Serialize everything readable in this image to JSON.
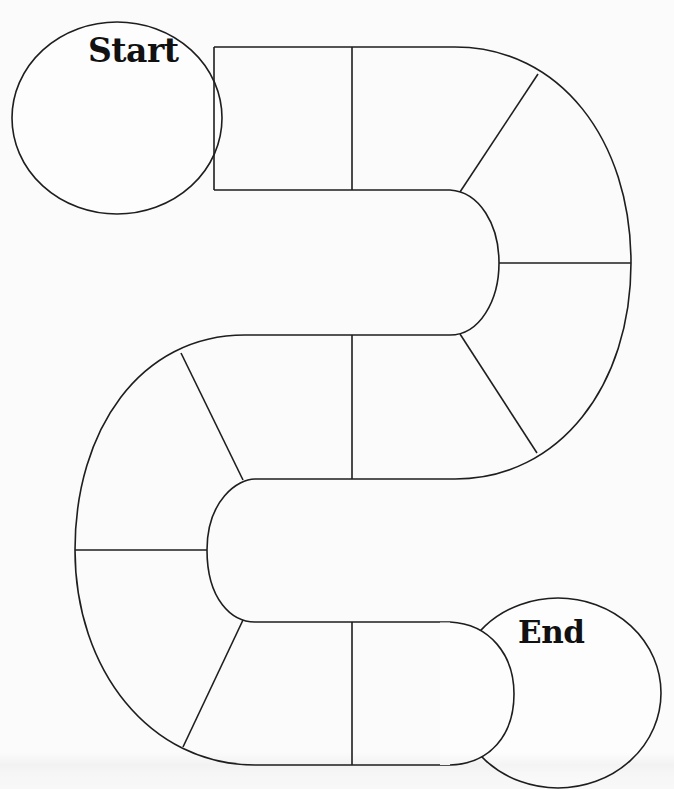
{
  "board": {
    "title": "Blank game board path",
    "start": {
      "label": "Start"
    },
    "end": {
      "label": "End"
    },
    "path_spaces_count": 16,
    "spaces": [
      {
        "id": 1,
        "section": "top-straight"
      },
      {
        "id": 2,
        "section": "top-straight"
      },
      {
        "id": 3,
        "section": "right-turn"
      },
      {
        "id": 4,
        "section": "right-turn"
      },
      {
        "id": 5,
        "section": "right-turn"
      },
      {
        "id": 6,
        "section": "right-turn"
      },
      {
        "id": 7,
        "section": "middle-straight"
      },
      {
        "id": 8,
        "section": "middle-straight"
      },
      {
        "id": 9,
        "section": "left-turn"
      },
      {
        "id": 10,
        "section": "left-turn"
      },
      {
        "id": 11,
        "section": "left-turn"
      },
      {
        "id": 12,
        "section": "left-turn"
      },
      {
        "id": 13,
        "section": "bottom-straight"
      },
      {
        "id": 14,
        "section": "bottom-straight"
      }
    ],
    "colors": {
      "line": "#1e1e1e",
      "background": "#fbfbfb",
      "text": "#111111"
    }
  }
}
